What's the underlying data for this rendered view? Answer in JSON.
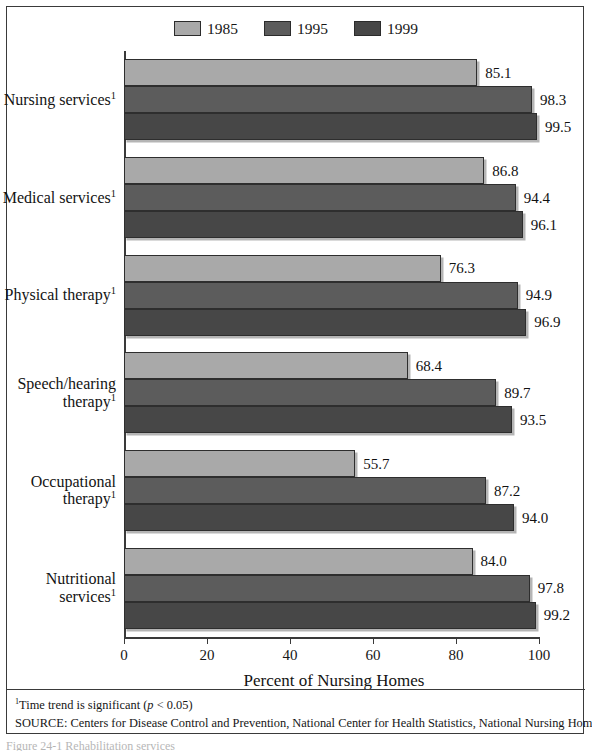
{
  "chart_data": {
    "type": "bar",
    "orientation": "horizontal",
    "title": "",
    "xlabel": "Percent of Nursing Homes",
    "ylabel": "",
    "xlim": [
      0,
      100
    ],
    "xticks": [
      0,
      20,
      40,
      60,
      80,
      100
    ],
    "grid": false,
    "legend_position": "top-center",
    "categories": [
      "Nursing services",
      "Medical services",
      "Physical therapy",
      "Speech/hearing therapy",
      "Occupational therapy",
      "Nutritional services"
    ],
    "category_footnote_marker": "1",
    "series": [
      {
        "name": "1985",
        "color": "#a9a9a9",
        "values": [
          85.1,
          86.8,
          76.3,
          68.4,
          55.7,
          84.0
        ]
      },
      {
        "name": "1995",
        "color": "#5c5c5c",
        "values": [
          98.3,
          94.4,
          94.9,
          89.7,
          87.2,
          97.8
        ]
      },
      {
        "name": "1999",
        "color": "#474747",
        "values": [
          99.5,
          96.1,
          96.9,
          93.5,
          94.0,
          99.2
        ]
      }
    ]
  },
  "legend": {
    "items": [
      {
        "label": "1985",
        "color": "#a9a9a9"
      },
      {
        "label": "1995",
        "color": "#5c5c5c"
      },
      {
        "label": "1999",
        "color": "#474747"
      }
    ]
  },
  "axis": {
    "x_title": "Percent of Nursing Homes",
    "tick_labels": [
      "0",
      "20",
      "40",
      "60",
      "80",
      "100"
    ]
  },
  "categories": [
    {
      "line1": "Nursing services",
      "line2": "",
      "marker": "1"
    },
    {
      "line1": "Medical services",
      "line2": "",
      "marker": "1"
    },
    {
      "line1": "Physical therapy",
      "line2": "",
      "marker": "1"
    },
    {
      "line1": "Speech/hearing",
      "line2": "therapy",
      "marker": "1"
    },
    {
      "line1": "Occupational",
      "line2": "therapy",
      "marker": "1"
    },
    {
      "line1": "Nutritional",
      "line2": "services",
      "marker": "1"
    }
  ],
  "notes": {
    "footnote_marker": "1",
    "footnote_pre": "Time trend is significant (",
    "footnote_ital": "p",
    "footnote_post": " < 0.05)",
    "source": "SOURCE: Centers for Disease Control and Prevention, National Center for Health Statistics, National Nursing Home Survey."
  },
  "caption": {
    "text": "Figure 24-1  Rehabilitation services"
  }
}
